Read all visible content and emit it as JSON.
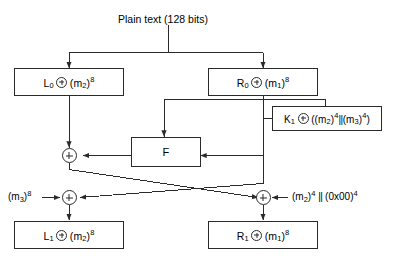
{
  "title": "Plain text (128 bits)",
  "diagram": {
    "name": "feistel-round-diagram",
    "stroke_color": "#2a2a2a",
    "background_color": "#ffffff"
  },
  "boxes": {
    "left_input": {
      "name": "box-L0",
      "label_parts": {
        "var": "L",
        "sub": "0",
        "operand": "(m",
        "operand_sub": "2",
        "operand_sup": ")",
        "exp": "8"
      },
      "text": "L0 + (m2)8"
    },
    "right_input": {
      "name": "box-R0",
      "text": "R0 + (m1)8"
    },
    "function": {
      "name": "box-F",
      "label": "F"
    },
    "key": {
      "name": "box-K1",
      "text": "K1 + ((m2)4||(m3)4)"
    },
    "left_output": {
      "name": "box-L1",
      "text": "L1 + (m2)8"
    },
    "right_output": {
      "name": "box-R1",
      "text": "R1 + (m1)8"
    }
  },
  "labels": {
    "left_feed": "(m3)8",
    "right_feed": "(m2)4 || (0x00)4"
  },
  "symbols": {
    "xor": "xor-circle-plus",
    "concat": "||"
  }
}
